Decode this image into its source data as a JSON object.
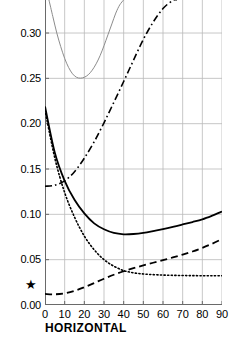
{
  "figure": {
    "background": "#ffffff",
    "caption_partial": ""
  },
  "axes": {
    "x": {
      "label": "HORIZONTAL",
      "ticks": [
        0,
        10,
        20,
        30,
        40,
        50,
        60,
        70,
        80,
        90
      ],
      "tick_labels": [
        "0",
        "10",
        "20",
        "30",
        "40",
        "50",
        "60",
        "70",
        "80",
        "90"
      ],
      "min": 0,
      "max": 90
    },
    "y": {
      "label": "",
      "ticks": [
        0.0,
        0.05,
        0.1,
        0.15,
        0.2,
        0.25,
        0.3
      ],
      "tick_labels": [
        "0.00",
        "0.05",
        "0.10",
        "0.15",
        "0.20",
        "0.25",
        "0.30"
      ],
      "min": 0.0,
      "max": 0.3365
    },
    "grid": "on",
    "grid_color": "#b9b9b9"
  },
  "markers": {
    "star": {
      "glyph": "★",
      "value": 0.022,
      "color": "#000000"
    }
  },
  "chart_data": {
    "type": "line",
    "title": "",
    "xlabel": "HORIZONTAL",
    "ylabel": "",
    "xlim": [
      0,
      90
    ],
    "ylim": [
      0.0,
      0.3365
    ],
    "grid": true,
    "legend": "none",
    "x": [
      0,
      5,
      10,
      15,
      20,
      25,
      30,
      35,
      40,
      45,
      50,
      55,
      60,
      65,
      70,
      75,
      80,
      85,
      90
    ],
    "series": [
      {
        "name": "grey-u-curve",
        "style": "solid",
        "color": "#8c8c8c",
        "width": 1.0,
        "clipped": true,
        "x": [
          2,
          4,
          6,
          8,
          10,
          12,
          14,
          16,
          18,
          20,
          22,
          24,
          26,
          28,
          30,
          32,
          34,
          36,
          38,
          40
        ],
        "values": [
          0.3365,
          0.318,
          0.3,
          0.285,
          0.272,
          0.262,
          0.255,
          0.2512,
          0.2502,
          0.2512,
          0.254,
          0.259,
          0.266,
          0.275,
          0.286,
          0.298,
          0.31,
          0.322,
          0.331,
          0.3365
        ]
      },
      {
        "name": "solid-black-curve",
        "style": "solid",
        "color": "#000000",
        "width": 1.8,
        "clipped": false,
        "values": [
          0.219,
          0.168,
          0.137,
          0.116,
          0.101,
          0.09,
          0.0835,
          0.0795,
          0.078,
          0.0783,
          0.0795,
          0.0815,
          0.0838,
          0.0862,
          0.0888,
          0.0915,
          0.0945,
          0.0985,
          0.103
        ]
      },
      {
        "name": "dotted-curve",
        "style": "dotted",
        "color": "#000000",
        "width": 1.6,
        "clipped": false,
        "values": [
          0.215,
          0.162,
          0.124,
          0.097,
          0.076,
          0.061,
          0.05,
          0.0428,
          0.038,
          0.0355,
          0.0342,
          0.0335,
          0.033,
          0.0327,
          0.0325,
          0.0324,
          0.0323,
          0.0322,
          0.0322
        ]
      },
      {
        "name": "dash-dot-curve",
        "style": "dashdot",
        "color": "#000000",
        "width": 1.6,
        "clipped": true,
        "x": [
          0,
          5,
          10,
          15,
          20,
          25,
          30,
          35,
          40,
          45,
          50,
          55,
          60,
          65,
          67
        ],
        "values": [
          0.131,
          0.1322,
          0.137,
          0.147,
          0.162,
          0.18,
          0.201,
          0.2235,
          0.2465,
          0.27,
          0.293,
          0.312,
          0.327,
          0.336,
          0.3365
        ]
      },
      {
        "name": "dashed-curve",
        "style": "dashed",
        "color": "#000000",
        "width": 1.8,
        "clipped": false,
        "values": [
          0.0122,
          0.0118,
          0.0128,
          0.0155,
          0.0196,
          0.0242,
          0.029,
          0.0334,
          0.0372,
          0.0406,
          0.0437,
          0.0466,
          0.0495,
          0.0524,
          0.0556,
          0.059,
          0.063,
          0.0676,
          0.0728
        ]
      }
    ]
  }
}
